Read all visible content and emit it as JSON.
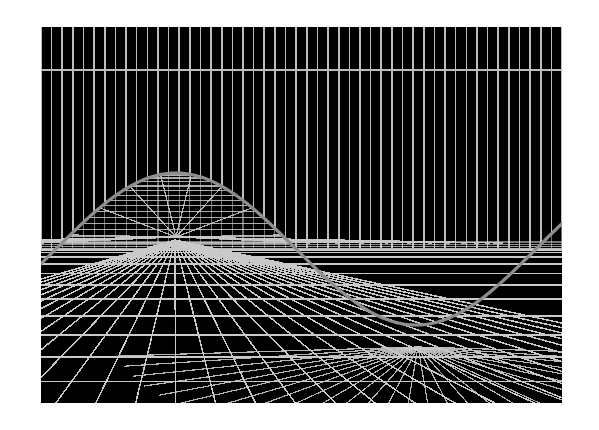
{
  "canvas": {
    "width": 599,
    "height": 430,
    "background_color": "#ffffff"
  },
  "viewport": {
    "name": "wireframe-render-viewport",
    "x": 41,
    "y": 27,
    "width": 521,
    "height": 376,
    "background_color": "#000000"
  },
  "palette": {
    "background": "#000000",
    "page": "#ffffff",
    "grid_line": "#c9c9c9",
    "wall_line": "#bdbdbd",
    "horizon_line": "#b5b5b5",
    "wave_outline": "#8e8e8e",
    "highlight": "#d8d8d8"
  },
  "scene": {
    "title": "3D perspective wireframe sine-wave surface",
    "projection": "one-point perspective",
    "vanishing_point": {
      "x": 175,
      "y": 240
    },
    "horizon_y": 249,
    "wall_top_y": 27,
    "wall_line_color": "#bdbdbd",
    "wall_line_count": 49,
    "wall_line_width": 1.6,
    "wall_band_top_y": 27,
    "wall_band_bottom_y": 249,
    "upper_horizontal_y": 70
  },
  "floor_grid": {
    "name": "perspective-floor-grid",
    "radial_line_count": 33,
    "depth_row_count": 13,
    "line_color": "#c9c9c9",
    "line_width": 1.5,
    "near_y": 403,
    "far_y": 249,
    "near_left_x": -520,
    "near_right_x": 1120
  },
  "wave": {
    "name": "sine-wave-surface-outline",
    "type": "sine",
    "color": "#8e8e8e",
    "stroke_width": 3.2,
    "amplitude_px": 76,
    "baseline_y": 249,
    "period_px": 480,
    "phase_x": 41,
    "crest": {
      "x": 176,
      "y": 173
    },
    "trough": {
      "x": 418,
      "y": 347
    },
    "left_edge_y": 256,
    "right_edge_y": 262,
    "sample_count": 260
  },
  "wave_fan": {
    "name": "crest-radial-fan",
    "fan_line_count": 31,
    "fan_apex": {
      "x": 176,
      "y": 243
    },
    "color": "#c9c9c9",
    "line_width": 1.2,
    "rung_count": 14
  },
  "trough_fan": {
    "name": "trough-radial-fan",
    "fan_line_count": 27,
    "fan_apex": {
      "x": 418,
      "y": 347
    },
    "color": "#c9c9c9",
    "line_width": 1.2
  },
  "chart_data": {
    "type": "line",
    "xlabel": "",
    "ylabel": "",
    "x": [
      0,
      30,
      60,
      90,
      120,
      150,
      180,
      210,
      240,
      270,
      300,
      330,
      360,
      390,
      420,
      450,
      480,
      510
    ],
    "series": [
      {
        "name": "sine wave surface profile (screen y)",
        "values": [
          256,
          216,
          187,
          174,
          178,
          198,
          228,
          262,
          297,
          326,
          344,
          347,
          334,
          309,
          277,
          244,
          217,
          262
        ]
      }
    ],
    "ylim": [
      170,
      410
    ],
    "grid": true,
    "legend": "none"
  }
}
